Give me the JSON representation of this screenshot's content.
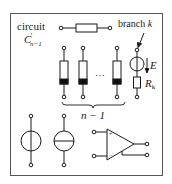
{
  "diagram": {
    "title_line1": "circuit",
    "title_symbol": "C",
    "title_prime": "′",
    "title_subscript": "n−1",
    "branch_label_word": "branch",
    "branch_label_var": "k",
    "source_label": "E",
    "resistor_label": "R",
    "resistor_subscript": "k",
    "ellipsis": "…",
    "count_label": "n − 1",
    "opamp_plus": "+",
    "opamp_minus": "−",
    "colors": {
      "stroke": "#1a1a1a",
      "fill_dark": "#111111",
      "background": "#ffffff",
      "frame": "#555555"
    },
    "components": [
      {
        "type": "resistor-horizontal",
        "label": ""
      },
      {
        "type": "two-terminal-element",
        "label": ""
      },
      {
        "type": "two-terminal-element",
        "label": ""
      },
      {
        "type": "two-terminal-element",
        "label": ""
      },
      {
        "type": "branch-k",
        "label": "voltage source E in series with R_k"
      },
      {
        "type": "voltage-source",
        "label": ""
      },
      {
        "type": "current-source",
        "label": ""
      },
      {
        "type": "op-amp",
        "label": ""
      }
    ]
  }
}
